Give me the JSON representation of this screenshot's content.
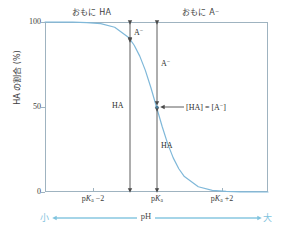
{
  "chart_data": {
    "type": "line",
    "title": "",
    "xlabel": "pH",
    "ylabel": "HA の割合 (%)",
    "ylim": [
      0,
      100
    ],
    "y_ticks": [
      "100",
      "50",
      "0"
    ],
    "y_tick_values": [
      100,
      50,
      0
    ],
    "x_tick_labels": [
      "pKa −2",
      "pKa",
      "pKa +2"
    ],
    "x_tick_positions": [
      -2,
      0,
      2
    ],
    "grid": false,
    "legend": false,
    "series": [
      {
        "name": "HA の割合",
        "color": "#7fb8d9",
        "x": [
          -4.0,
          -3.5,
          -3.0,
          -2.5,
          -2.0,
          -1.5,
          -1.0,
          -0.8,
          -0.6,
          -0.4,
          -0.2,
          0.0,
          0.2,
          0.4,
          0.6,
          0.8,
          1.0,
          1.5,
          2.0,
          2.5,
          3.0,
          3.5,
          4.0
        ],
        "values": [
          99.99,
          99.97,
          99.9,
          99.68,
          99.01,
          96.93,
          90.91,
          86.32,
          79.92,
          71.53,
          61.32,
          50.0,
          38.68,
          28.47,
          20.08,
          13.68,
          9.09,
          3.07,
          0.99,
          0.32,
          0.1,
          0.03,
          0.01
        ]
      }
    ]
  },
  "headers": {
    "left": "おもに HA",
    "right": "おもに A⁻"
  },
  "y_axis": {
    "title": "HA の割合 (%)",
    "tick_100": "100",
    "tick_50": "50",
    "tick_0": "0"
  },
  "x_axis": {
    "tick_1_prefix": "p",
    "tick_1_italic": "K",
    "tick_1_sub": "a",
    "tick_1_suffix": " −2",
    "tick_2_prefix": "p",
    "tick_2_italic": "K",
    "tick_2_sub": "a",
    "tick_2_suffix": "",
    "tick_3_prefix": "p",
    "tick_3_italic": "K",
    "tick_3_sub": "a",
    "tick_3_suffix": " +2"
  },
  "annotations": {
    "a_minus_top": "A",
    "a_minus_top_sup": "−",
    "a_minus_mid": "A",
    "a_minus_mid_sup": "−",
    "ha_left": "HA",
    "ha_right": "HA",
    "equality_part1": "[HA] = [A",
    "equality_sup": "−",
    "equality_part2": "]"
  },
  "ph_bar": {
    "small": "小",
    "large": "大",
    "label": "pH"
  },
  "colors": {
    "curve": "#7fb8d9",
    "frame": "#9fb3c0",
    "accent": "#7fc3de",
    "arrow": "#4a4a4a",
    "text": "#3d3d3d"
  }
}
